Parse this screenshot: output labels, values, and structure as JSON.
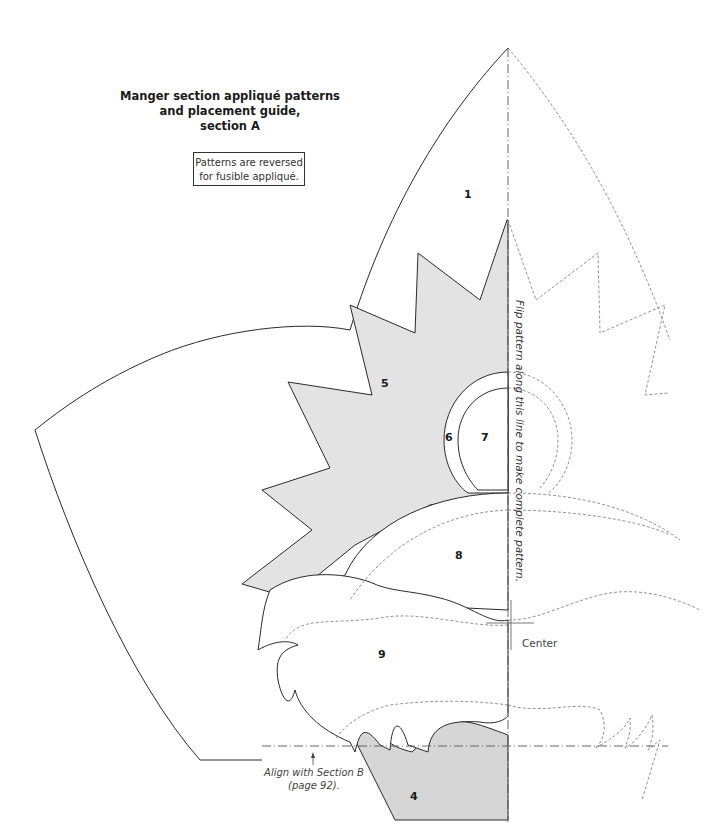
{
  "title": {
    "line1": "Manger section appliqué patterns",
    "line2": "and placement guide,",
    "line3": "section A"
  },
  "note": {
    "line1": "Patterns are reversed",
    "line2": "for fusible appliqué."
  },
  "pieces": [
    {
      "id": "1",
      "label": "1"
    },
    {
      "id": "4",
      "label": "4"
    },
    {
      "id": "5",
      "label": "5"
    },
    {
      "id": "6",
      "label": "6"
    },
    {
      "id": "7",
      "label": "7"
    },
    {
      "id": "8",
      "label": "8"
    },
    {
      "id": "9",
      "label": "9"
    }
  ],
  "annotations": {
    "flip_line": "Flip pattern along this line to make complete pattern.",
    "center": "Center",
    "align_line1": "Align with Section B",
    "align_line2": "(page 92)."
  },
  "colors": {
    "shaded_fill": "#e3e3e3",
    "outline": "#2a2a2a",
    "dashed": "#777777"
  }
}
